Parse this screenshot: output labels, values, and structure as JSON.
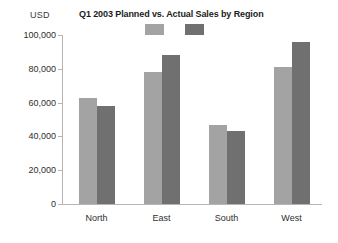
{
  "header": {
    "unit_label": "USD",
    "title": "Q1 2003 Planned vs. Actual Sales by Region"
  },
  "legend": {
    "position": "top-center",
    "entries": [
      {
        "name": "planned-swatch",
        "label": "",
        "color": "#a3a3a3"
      },
      {
        "name": "actual-swatch",
        "label": "",
        "color": "#707070"
      }
    ]
  },
  "axis": {
    "y_ticks": [
      "0",
      "20,000",
      "40,000",
      "60,000",
      "80,000",
      "100,000"
    ],
    "x_ticks": [
      "North",
      "East",
      "South",
      "West"
    ]
  },
  "chart_data": {
    "type": "bar",
    "title": "Q1 2003 Planned vs. Actual Sales by Region",
    "xlabel": "",
    "ylabel": "USD",
    "ylim": [
      0,
      100000
    ],
    "ytick_values": [
      0,
      20000,
      40000,
      60000,
      80000,
      100000
    ],
    "grid": false,
    "legend_position": "top-center",
    "categories": [
      "North",
      "East",
      "South",
      "West"
    ],
    "series": [
      {
        "name": "Planned",
        "color": "#a3a3a3",
        "values": [
          62500,
          78000,
          47000,
          81000
        ]
      },
      {
        "name": "Actual",
        "color": "#707070",
        "values": [
          58000,
          88000,
          43500,
          96000
        ]
      }
    ]
  }
}
